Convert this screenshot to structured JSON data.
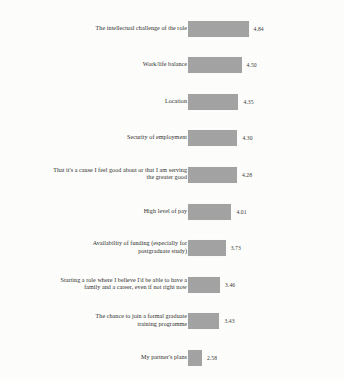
{
  "chart_data": {
    "type": "bar",
    "orientation": "horizontal",
    "title": "",
    "subtitle": "",
    "xlabel": "",
    "ylabel": "",
    "grid": false,
    "legend": false,
    "axis_visible": false,
    "tick_labels_x": [],
    "value_label_format": "0.00",
    "bar_color": "#a3a3a3",
    "text_color": "#2e2d2b",
    "background_color": "#ffffff",
    "xlim": [
      2.0,
      5.0
    ],
    "categories": [
      "The intellectual challenge of the role",
      "Work/life balance",
      "Location",
      "Security of employment",
      "That it's a cause I feel good about or that I am serving\nthe greater good",
      "High level of pay",
      "Availability of funding (especially for\npostgraduate study)",
      "Starting a role where I believe I'd be able to have a\nfamily and a career, even if not right now",
      "The chance to join a formal graduate\ntraining programme",
      "My partner's plans"
    ],
    "values": [
      4.84,
      4.5,
      4.35,
      4.3,
      4.28,
      4.01,
      3.73,
      3.46,
      3.43,
      2.58
    ],
    "value_labels": [
      "4.84",
      "4.50",
      "4.35",
      "4.30",
      "4.28",
      "4.01",
      "3.73",
      "3.46",
      "3.43",
      "2.58"
    ],
    "bars": [
      {
        "category": "The intellectual challenge of the role",
        "value": 4.84,
        "label": "4.84"
      },
      {
        "category": "Work/life balance",
        "value": 4.5,
        "label": "4.50"
      },
      {
        "category": "Location",
        "value": 4.35,
        "label": "4.35"
      },
      {
        "category": "Security of employment",
        "value": 4.3,
        "label": "4.30"
      },
      {
        "category": "That it's a cause I feel good about or that I am serving the greater good",
        "value": 4.28,
        "label": "4.28"
      },
      {
        "category": "High level of pay",
        "value": 4.01,
        "label": "4.01"
      },
      {
        "category": "Availability of funding (especially for postgraduate study)",
        "value": 3.73,
        "label": "3.73"
      },
      {
        "category": "Starting a role where I believe I'd be able to have a family and a career, even if not right now",
        "value": 3.46,
        "label": "3.46"
      },
      {
        "category": "The chance to join a formal graduate training programme",
        "value": 3.43,
        "label": "3.43"
      },
      {
        "category": "My partner's plans",
        "value": 2.58,
        "label": "2.58"
      }
    ]
  },
  "layout": {
    "bar_origin_x_px": 188,
    "bar_height_px": 16,
    "row_pitch_px": 36.6,
    "first_row_top_px": 20
  }
}
